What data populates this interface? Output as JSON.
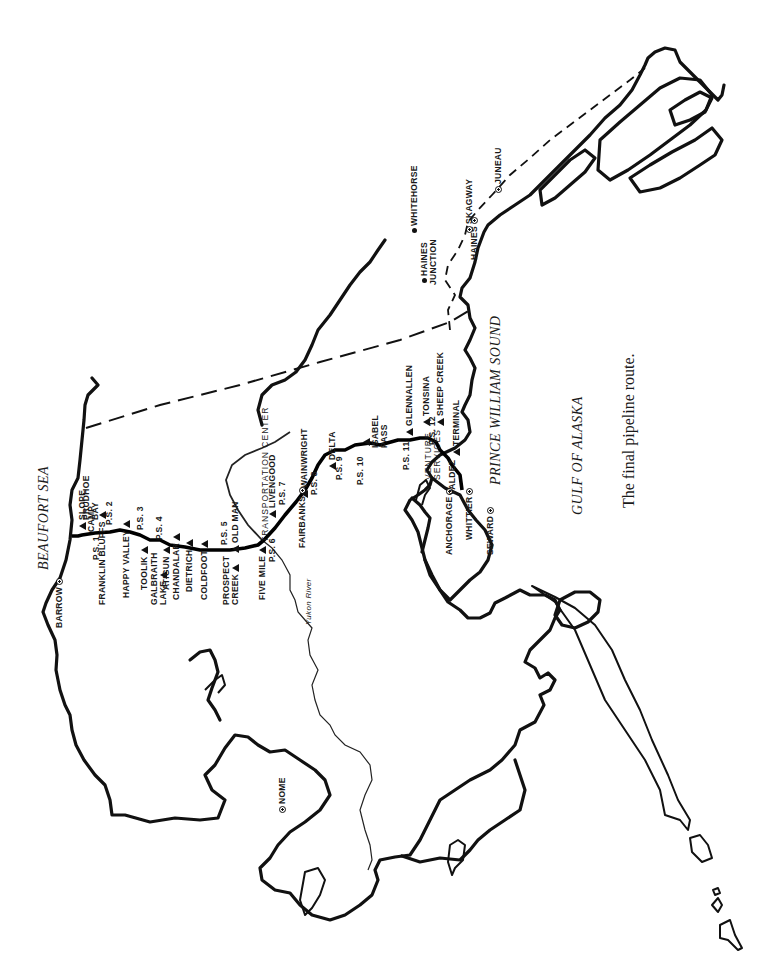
{
  "caption": "The final pipeline route.",
  "water_bodies": {
    "beaufort_sea": "BEAUFORT SEA",
    "prince_william_sound": "PRINCE WILLIAM SOUND",
    "gulf_of_alaska": "GULF OF ALASKA"
  },
  "river": "Yukon River",
  "cities": [
    {
      "id": "barrow",
      "label": "BARROW"
    },
    {
      "id": "nome",
      "label": "NOME"
    },
    {
      "id": "fairbanks",
      "label": "FAIRBANKS"
    },
    {
      "id": "anchorage",
      "label": "ANCHORAGE"
    },
    {
      "id": "whittier",
      "label": "WHITTIER"
    },
    {
      "id": "seward",
      "label": "SEWARD"
    },
    {
      "id": "valdez",
      "label": "VALDEZ"
    },
    {
      "id": "haines",
      "label": "HAINES"
    },
    {
      "id": "skagway",
      "label": "SKAGWAY"
    },
    {
      "id": "juneau",
      "label": "JUNEAU"
    },
    {
      "id": "whitehorse",
      "label": "WHITEHORSE"
    },
    {
      "id": "haines_junction",
      "label": "HAINES JUNCTION"
    }
  ],
  "camps": [
    {
      "id": "prudhoe_bay",
      "label": "PRUDHOE BAY"
    },
    {
      "id": "slope_camp",
      "label": "SLOPE CAMP"
    },
    {
      "id": "franklin_bluffs",
      "label": "FRANKLIN BLUFFS"
    },
    {
      "id": "happy_valley",
      "label": "HAPPY VALLEY"
    },
    {
      "id": "toolik",
      "label": "TOOLIK"
    },
    {
      "id": "galbraith_lake",
      "label": "GALBRAITH LAKE"
    },
    {
      "id": "atigun",
      "label": "ATIGUN"
    },
    {
      "id": "chandalar",
      "label": "CHANDALAR"
    },
    {
      "id": "dietrich",
      "label": "DIETRICH"
    },
    {
      "id": "coldfoot",
      "label": "COLDFOOT"
    },
    {
      "id": "prospect_creek",
      "label": "PROSPECT CREEK"
    },
    {
      "id": "old_man",
      "label": "OLD MAN"
    },
    {
      "id": "five_mile",
      "label": "FIVE MILE"
    },
    {
      "id": "transportation_center",
      "label": "TRANSPORTATION CENTER"
    },
    {
      "id": "livengood",
      "label": "LIVENGOOD"
    },
    {
      "id": "wainwright",
      "label": "WAINWRIGHT"
    },
    {
      "id": "delta",
      "label": "DELTA"
    },
    {
      "id": "isabel_pass",
      "label": "ISABEL PASS"
    },
    {
      "id": "glennallen",
      "label": "GLENNALLEN"
    },
    {
      "id": "tonsina",
      "label": "TONSINA"
    },
    {
      "id": "sheep_creek",
      "label": "SHEEP CREEK"
    },
    {
      "id": "venture_services",
      "label": "VENTURE SERVICES"
    },
    {
      "id": "terminal",
      "label": "TERMINAL"
    }
  ],
  "pump_stations": [
    "P.S. 1",
    "P.S. 2",
    "P.S. 3",
    "P.S. 4",
    "P.S. 5",
    "P.S. 6",
    "P.S. 7",
    "P.S. 8",
    "P.S. 9",
    "P.S. 10",
    "P.S. 11",
    "P.S. 12"
  ],
  "legend_symbols": {
    "camp": "triangle",
    "city": "circle-dot",
    "town": "dot",
    "pump_station": "square"
  }
}
